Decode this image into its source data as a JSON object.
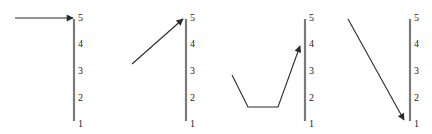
{
  "diagram": {
    "scale_labels": [
      "5",
      "4",
      "3",
      "2",
      "1"
    ],
    "panels": [
      {
        "id": 1,
        "trajectory": "horizontal arrow pointing to level 5",
        "target_level": 5,
        "labels": {
          "l5": "5",
          "l4": "4",
          "l3": "3",
          "l2": "2",
          "l1": "1"
        }
      },
      {
        "id": 2,
        "trajectory": "diagonal arrow rising from about level 3 to level 5",
        "target_level": 5,
        "labels": {
          "l5": "5",
          "l4": "4",
          "l3": "3",
          "l2": "2",
          "l1": "1"
        }
      },
      {
        "id": 3,
        "trajectory": "descends, flat at bottom, then rises to about level 4",
        "target_level": 4,
        "labels": {
          "l5": "5",
          "l4": "4",
          "l3": "3",
          "l2": "2",
          "l1": "1"
        }
      },
      {
        "id": 4,
        "trajectory": "diagonal arrow falling from level 5 to level 1",
        "target_level": 1,
        "labels": {
          "l5": "5",
          "l4": "4",
          "l3": "3",
          "l2": "2",
          "l1": "1"
        }
      }
    ],
    "colors": {
      "axis": "#7a7a7a",
      "arrow": "#2a2a2a",
      "background": "#ffffff"
    }
  }
}
